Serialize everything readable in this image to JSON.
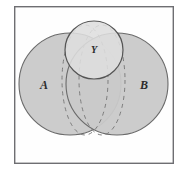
{
  "figure": {
    "type": "venn-euler-diagram",
    "title": "",
    "canvas": {
      "width": 187,
      "height": 178
    },
    "background_color": "#fdfdfd",
    "frame": {
      "name": "figure-border",
      "x": 14,
      "y": 6,
      "width": 160,
      "height": 158,
      "stroke_color": "#6e6e72",
      "stroke_width": 1.4,
      "fill": "#fefefe"
    },
    "shapes": [
      {
        "id": "circle-a",
        "label": "A",
        "kind": "circle",
        "cx": 70,
        "cy": 84,
        "r": 51,
        "fill": "#c9c9c9",
        "stroke": "#6a6a6a",
        "stroke_width": 1.1,
        "dashed": false
      },
      {
        "id": "circle-b",
        "label": "B",
        "kind": "circle",
        "cx": 117,
        "cy": 84,
        "r": 51,
        "fill": "#c9c9c9",
        "stroke": "#6a6a6a",
        "stroke_width": 1.1,
        "dashed": false
      },
      {
        "id": "circle-y",
        "label": "Y",
        "kind": "circle",
        "cx": 94,
        "cy": 50,
        "r": 29,
        "fill": "#dedede",
        "stroke": "#555555",
        "stroke_width": 1.2,
        "dashed": false
      },
      {
        "id": "ellipse-dashed-left",
        "label": "",
        "kind": "ellipse-dashed",
        "cx": 85,
        "cy": 80,
        "rx": 23,
        "ry": 55,
        "fill": "none",
        "stroke": "#7d7d7d",
        "stroke_width": 1.0,
        "dashed": true,
        "dash_pattern": "4 4"
      },
      {
        "id": "ellipse-dashed-right",
        "label": "",
        "kind": "ellipse-dashed",
        "cx": 102,
        "cy": 80,
        "rx": 23,
        "ry": 55,
        "fill": "none",
        "stroke": "#7d7d7d",
        "stroke_width": 1.0,
        "dashed": true,
        "dash_pattern": "4 4"
      }
    ],
    "labels": [
      {
        "id": "label-a",
        "text": "A",
        "x": 44,
        "y": 89,
        "size": "big"
      },
      {
        "id": "label-b",
        "text": "B",
        "x": 144,
        "y": 89,
        "size": "big"
      },
      {
        "id": "label-y",
        "text": "Y",
        "x": 94,
        "y": 53,
        "size": "small"
      }
    ],
    "colors": {
      "set_fill": "#c9c9c9",
      "subset_fill": "#dedede",
      "outline": "#6a6a6a",
      "dashed_outline": "#7d7d7d",
      "frame": "#6e6e72",
      "label_text": "#2b2b2b"
    }
  }
}
